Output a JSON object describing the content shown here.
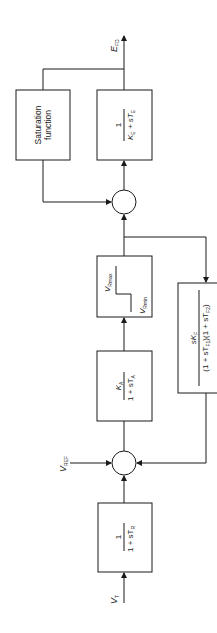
{
  "diagram": {
    "type": "block-diagram",
    "orientation": "rotated-90-ccw",
    "blocks": {
      "transducer": {
        "num": "1",
        "den": "1 + sT",
        "den_sub": "R"
      },
      "regulator": {
        "num": "K",
        "num_sub": "A",
        "den": "1 + sT",
        "den_sub": "A"
      },
      "limiter": {
        "max": "V",
        "max_sub": "Rmax",
        "min": "V",
        "min_sub": "Rmin"
      },
      "exciter": {
        "num": "1",
        "den_a": "K",
        "den_a_sub": "E",
        "den_b": " + sT",
        "den_b_sub": "E"
      },
      "saturation": {
        "line1": "Saturation",
        "line2": "function"
      },
      "stabilizer": {
        "num": "sK",
        "num_sub": "F",
        "den": "(1 + sT",
        "den_sub1": "F1",
        "den_mid": ")(1 + sT",
        "den_sub2": "F2",
        "den_end": ")"
      }
    },
    "signals": {
      "input_vt": {
        "main": "V",
        "sub": "T"
      },
      "input_vref": {
        "main": "V",
        "sub": "REF"
      },
      "output_efd": {
        "main": "E",
        "sub": "FD"
      }
    }
  }
}
